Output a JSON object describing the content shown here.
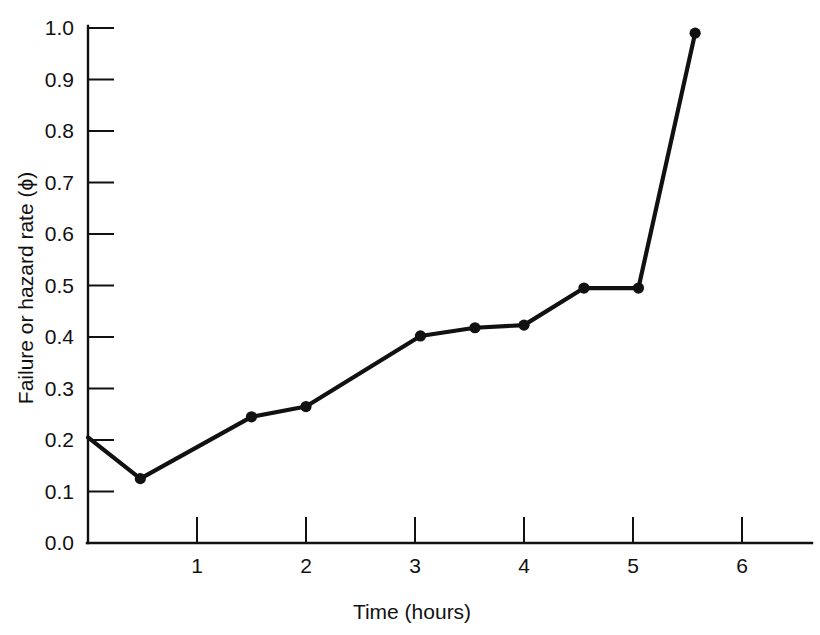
{
  "chart_data": {
    "type": "line",
    "title": "",
    "xlabel": "Time  (hours)",
    "ylabel": "Failure or hazard rate  (ϕ)",
    "xlim": [
      0,
      6.7
    ],
    "ylim": [
      0.0,
      1.0
    ],
    "grid": false,
    "legend": null,
    "xticks": [
      1,
      2,
      3,
      4,
      5,
      6
    ],
    "xtick_labels": [
      "1",
      "2",
      "3",
      "4",
      "5",
      "6"
    ],
    "yticks": [
      0.0,
      0.1,
      0.2,
      0.3,
      0.4,
      0.5,
      0.6,
      0.7,
      0.8,
      0.9,
      1.0
    ],
    "ytick_labels": [
      "0.0",
      "0.1",
      "0.2",
      "0.3",
      "0.4",
      "0.5",
      "0.6",
      "0.7",
      "0.8",
      "0.9",
      "1.0"
    ],
    "series": [
      {
        "name": "Failure or hazard rate",
        "color": "#111111",
        "marker": "circle",
        "x": [
          0.0,
          0.48,
          1.5,
          2.0,
          3.05,
          3.55,
          4.0,
          4.55,
          5.05,
          5.57
        ],
        "y": [
          0.205,
          0.125,
          0.245,
          0.265,
          0.402,
          0.418,
          0.423,
          0.495,
          0.495,
          0.99
        ],
        "marker_visible": [
          false,
          true,
          true,
          true,
          true,
          true,
          true,
          true,
          true,
          true
        ]
      }
    ]
  },
  "axes": {
    "x_axis_name": "time-axis",
    "y_axis_name": "hazard-rate-axis"
  }
}
